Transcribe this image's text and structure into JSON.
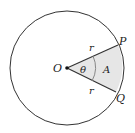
{
  "diagram": {
    "labels": {
      "center": "O",
      "point_p": "P",
      "point_q": "Q",
      "radius_upper": "r",
      "radius_lower": "r",
      "angle": "θ",
      "area": "A"
    },
    "colors": {
      "stroke": "#333333",
      "sector_fill": "#e6e6e6",
      "angle_arc": "#888888"
    }
  }
}
